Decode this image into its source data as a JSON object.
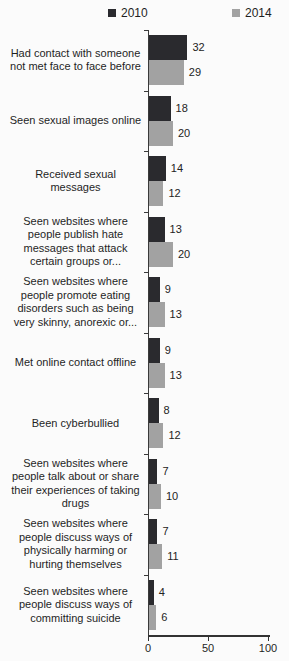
{
  "chart_data": {
    "type": "bar",
    "orientation": "horizontal",
    "title": "",
    "xlabel": "",
    "ylabel": "",
    "xlim": [
      0,
      100
    ],
    "xticks": [
      0,
      50,
      100
    ],
    "grid": false,
    "legend_position": "top",
    "value_labels": true,
    "categories": [
      "Had contact with someone not met face to face before",
      "Seen sexual images online",
      "Received sexual messages",
      "Seen websites where people publish hate messages that attack certain groups or...",
      "Seen websites where people promote eating disorders such as being very skinny, anorexic or...",
      "Met online contact offline",
      "Been cyberbullied",
      "Seen websites where people talk about or share their experiences of taking drugs",
      "Seen websites where people discuss ways of physically harming or hurting themselves",
      "Seen websites where people discuss ways of committing suicide"
    ],
    "series": [
      {
        "name": "2010",
        "color": "#2a2a2e",
        "values": [
          32,
          18,
          14,
          13,
          9,
          9,
          8,
          7,
          7,
          4
        ]
      },
      {
        "name": "2014",
        "color": "#a2a2a2",
        "values": [
          29,
          20,
          12,
          20,
          13,
          13,
          12,
          10,
          11,
          6
        ]
      }
    ]
  },
  "colors": {
    "axis": "#3a3a3a",
    "text": "#1f1f1f",
    "background": "#fbfbfb"
  }
}
